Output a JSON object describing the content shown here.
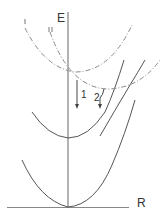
{
  "diagram": {
    "type": "potential-energy-curves",
    "axes": {
      "y_label": "E",
      "x_label": "R"
    },
    "curve_labels": {
      "upper_dashed_1": "I",
      "upper_dashed_2": "II"
    },
    "transitions": [
      {
        "label": "1"
      },
      {
        "label": "2"
      }
    ],
    "colors": {
      "line": "#555555",
      "dashed": "#8a8a8a",
      "axis": "#666666"
    }
  }
}
